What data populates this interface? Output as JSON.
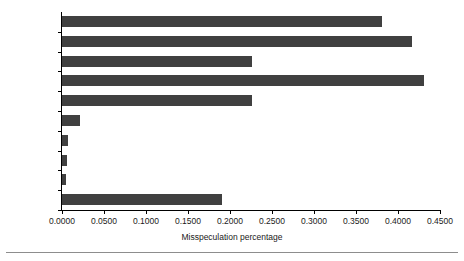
{
  "chart_data": {
    "type": "bar",
    "orientation": "horizontal",
    "title": "",
    "xlabel": "Misspeculation percentage",
    "ylabel": "",
    "xlim": [
      0.0,
      0.45
    ],
    "xticks": [
      0.0,
      0.05,
      0.1,
      0.15,
      0.2,
      0.25,
      0.3,
      0.35,
      0.4,
      0.45
    ],
    "xtick_labels": [
      "0.0000",
      "0.0500",
      "0.1000",
      "0.1500",
      "0.2000",
      "0.2500",
      "0.3000",
      "0.3500",
      "0.4000",
      "0.4500"
    ],
    "grid": false,
    "legend": null,
    "categories": [
      "gzip",
      "vpr",
      "gcc",
      "mcf",
      "crafty",
      "wupwise",
      "swim",
      "mgrid",
      "applu",
      "mesa"
    ],
    "values": [
      0.381,
      0.417,
      0.226,
      0.431,
      0.226,
      0.021,
      0.007,
      0.006,
      0.005,
      0.19
    ],
    "bar_color": "#404040",
    "axis_color": "#000000",
    "background_color": "#ffffff"
  }
}
